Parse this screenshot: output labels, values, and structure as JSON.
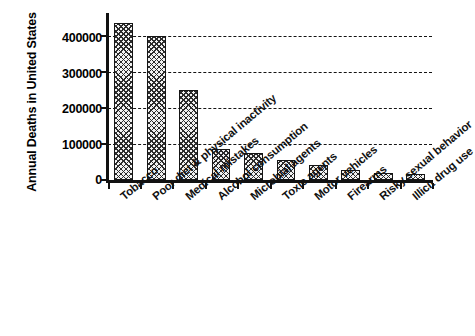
{
  "chart_data": {
    "type": "bar",
    "title": "",
    "xlabel": "",
    "ylabel": "Annual Deaths in United States",
    "ylim": [
      0,
      450000
    ],
    "yticks": [
      "0",
      "100000",
      "200000",
      "300000",
      "400000"
    ],
    "ytick_values": [
      0,
      100000,
      200000,
      300000,
      400000
    ],
    "grid": "horizontal-dashed",
    "legend": "none",
    "bar_fill": "crosshatch",
    "categories": [
      "Tobacco",
      "Poor diet & physical inactivity",
      "Medical mistakes",
      "Alcohol consumption",
      "Microbial agents",
      "Toxic agents",
      "Motor vehicles",
      "Firearms",
      "Risky sexual behavior",
      "Illicit drug use"
    ],
    "values": [
      435000,
      400000,
      250000,
      85000,
      75000,
      55000,
      43000,
      29000,
      20000,
      17000
    ]
  },
  "colors": {
    "axis": "#111111",
    "bar_outline": "#151515",
    "bar_hatch": "#2b2b2b",
    "background": "#ffffff",
    "gridline": "#141414"
  }
}
